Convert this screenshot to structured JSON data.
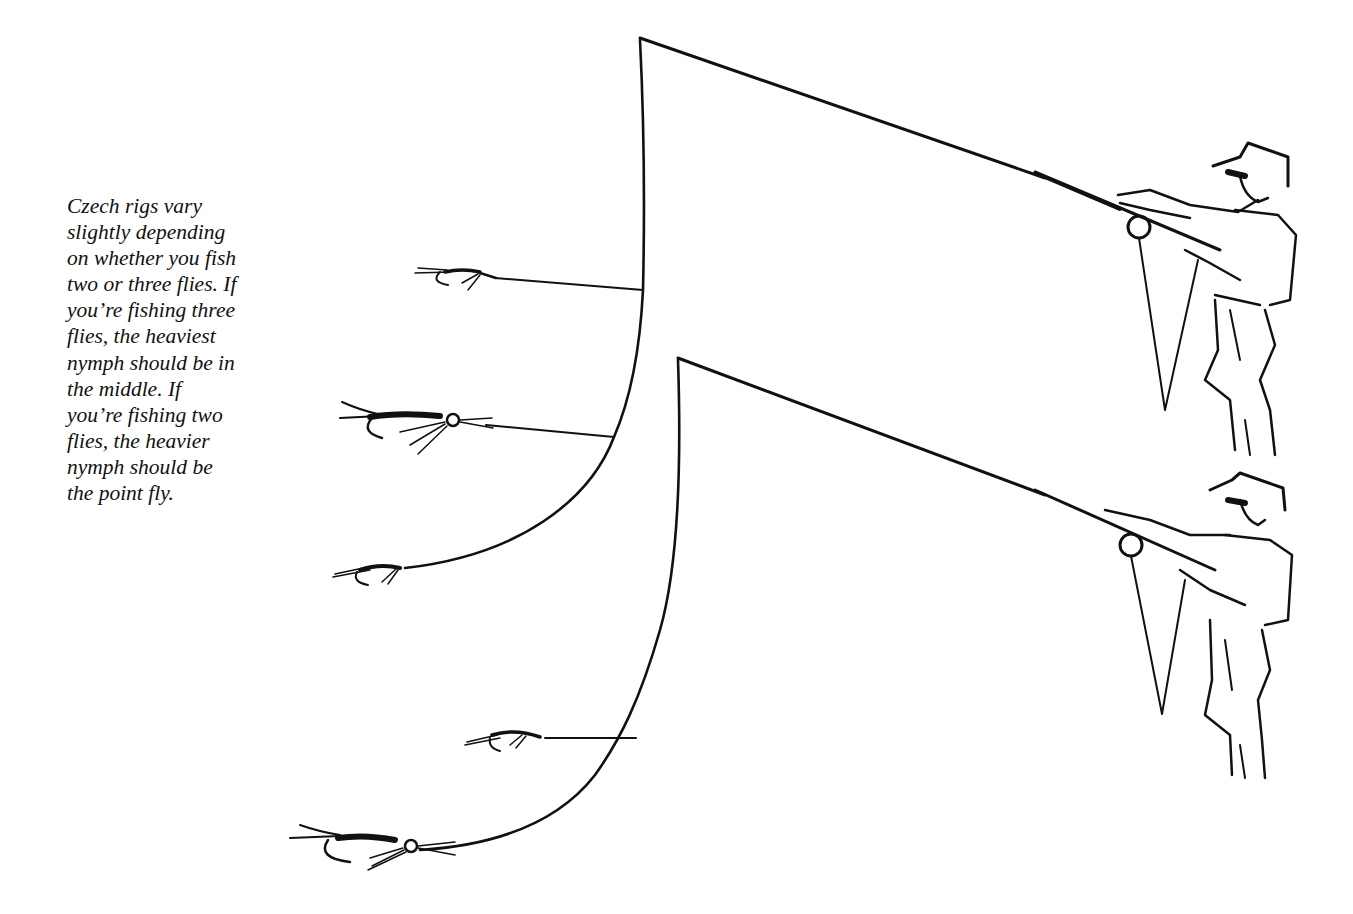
{
  "caption": {
    "lines": [
      "Czech rigs vary",
      "slightly depending",
      "on whether you fish",
      "two or three flies. If",
      "you’re fishing three",
      "flies, the heaviest",
      "nymph should be in",
      "the middle. If",
      "you’re fishing two",
      "flies, the heavier",
      "nymph should be",
      "the point fly."
    ]
  },
  "illustration": {
    "rigs": [
      {
        "name": "three-fly rig",
        "flies": [
          "dropper-fly",
          "heaviest-nymph-middle",
          "point-fly"
        ]
      },
      {
        "name": "two-fly rig",
        "flies": [
          "dropper-fly",
          "heavier-nymph-point"
        ]
      }
    ],
    "colors": {
      "ink": "#111111",
      "background": "#ffffff"
    }
  }
}
